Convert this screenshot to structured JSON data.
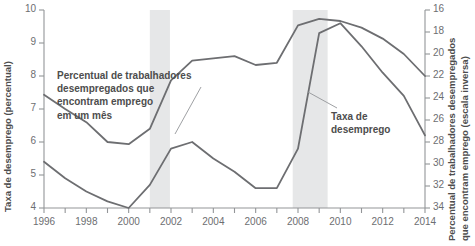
{
  "chart_data": {
    "type": "line",
    "title": "",
    "xlabel": "",
    "ylabel": "Taxa de desemprego (percentual)",
    "y2label": "Percentual de trabalhadores desempregados que encontram emprego (escala inversa)",
    "grid": false,
    "legend_position": "inline-annotations",
    "x": [
      1996,
      1997,
      1998,
      1999,
      2000,
      2001,
      2002,
      2003,
      2004,
      2005,
      2006,
      2007,
      2008,
      2009,
      2010,
      2011,
      2012,
      2013,
      2014
    ],
    "xlim": [
      1996,
      2014
    ],
    "xticks": [
      1996,
      1998,
      2000,
      2002,
      2004,
      2006,
      2008,
      2010,
      2012,
      2014
    ],
    "xtick_labels": [
      "1996",
      "1998",
      "2000",
      "2002",
      "2004",
      "2006",
      "2008",
      "2010",
      "2012",
      "2014"
    ],
    "ylim": [
      4,
      10
    ],
    "yticks": [
      4,
      5,
      6,
      7,
      8,
      9,
      10
    ],
    "ytick_labels": [
      "4",
      "5",
      "6",
      "7",
      "8",
      "9",
      "10"
    ],
    "y2lim": [
      34,
      16
    ],
    "y2_inverted": true,
    "y2ticks": [
      16,
      18,
      20,
      22,
      24,
      26,
      28,
      30,
      32,
      34
    ],
    "y2tick_labels": [
      "16",
      "18",
      "20",
      "22",
      "24",
      "26",
      "28",
      "30",
      "32",
      "34"
    ],
    "series": [
      {
        "name": "Percentual de trabalhadores desempregados que encontram emprego em um mês",
        "axis": "right",
        "color": "#6d6e71",
        "values": [
          23.7,
          25.0,
          26.2,
          28.0,
          28.2,
          26.8,
          22.4,
          20.6,
          20.4,
          20.2,
          21.0,
          20.8,
          17.4,
          16.8,
          17.0,
          17.6,
          18.6,
          20.0,
          22.0
        ]
      },
      {
        "name": "Taxa de desemprego",
        "axis": "left",
        "color": "#6d6e71",
        "values": [
          5.4,
          4.9,
          4.5,
          4.2,
          4.0,
          4.7,
          5.8,
          6.0,
          5.5,
          5.1,
          4.6,
          4.6,
          5.8,
          9.3,
          9.6,
          8.9,
          8.1,
          7.4,
          6.2
        ]
      }
    ],
    "shaded_bands": [
      {
        "name": "recession-band-2001",
        "x_start": 2001.0,
        "x_end": 2001.95,
        "color": "#e6e7e8"
      },
      {
        "name": "recession-band-2008",
        "x_start": 2007.75,
        "x_end": 2009.4,
        "color": "#e6e7e8"
      }
    ],
    "annotations": [
      {
        "name": "job-finding-rate-annotation",
        "lines": [
          "Percentual de trabalhadores",
          "desempregados que",
          "encontram emprego",
          "em um mês"
        ],
        "leader_from": [
          175,
          134
        ],
        "leader_to": [
          201,
          87
        ]
      },
      {
        "name": "unemployment-rate-annotation",
        "lines": [
          "Taxa de",
          "desemprego"
        ],
        "leader_from": [
          308,
          92
        ],
        "leader_to": [
          337,
          108
        ]
      }
    ],
    "colors": {
      "line": "#6d6e71",
      "axis": "#939598",
      "text": "#58595b",
      "band": "#e6e7e8",
      "background": "#ffffff"
    }
  }
}
